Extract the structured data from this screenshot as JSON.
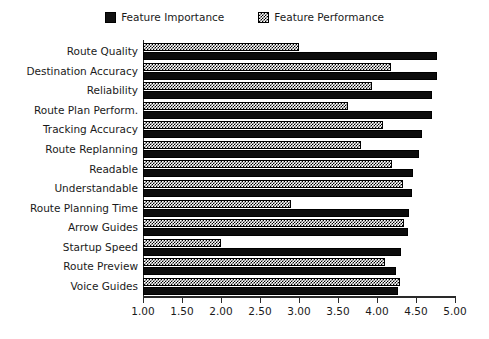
{
  "chart_data": {
    "type": "bar",
    "orientation": "horizontal",
    "title": "",
    "xlabel": "",
    "ylabel": "",
    "xlim": [
      1.0,
      5.0
    ],
    "xticks": [
      "1.00",
      "1.50",
      "2.00",
      "2.50",
      "3.00",
      "3.50",
      "4.00",
      "4.50",
      "5.00"
    ],
    "xtick_values": [
      1.0,
      1.5,
      2.0,
      2.5,
      3.0,
      3.5,
      4.0,
      4.5,
      5.0
    ],
    "grid": false,
    "legend_position": "top-center",
    "categories": [
      "Route Quality",
      "Destination Accuracy",
      "Reliability",
      "Route Plan Perform.",
      "Tracking Accuracy",
      "Route Replanning",
      "Readable",
      "Understandable",
      "Route Planning Time",
      "Arrow Guides",
      "Startup Speed",
      "Route Preview",
      "Voice Guides"
    ],
    "series": [
      {
        "name": "Feature Importance",
        "color": "#0c0c0c",
        "pattern": "solid",
        "values": [
          4.77,
          4.77,
          4.71,
          4.71,
          4.58,
          4.54,
          4.46,
          4.45,
          4.41,
          4.4,
          4.31,
          4.24,
          4.27
        ]
      },
      {
        "name": "Feature Performance",
        "color": "#ffffff",
        "pattern": "checker",
        "values": [
          3.0,
          4.18,
          3.94,
          3.63,
          4.08,
          3.79,
          4.19,
          4.33,
          2.9,
          4.35,
          2.0,
          4.1,
          4.29
        ]
      }
    ]
  },
  "legend": {
    "entries": [
      {
        "label": "Feature Importance",
        "swatch": "solid-black-square-icon"
      },
      {
        "label": "Feature Performance",
        "swatch": "checkered-square-icon"
      }
    ]
  }
}
